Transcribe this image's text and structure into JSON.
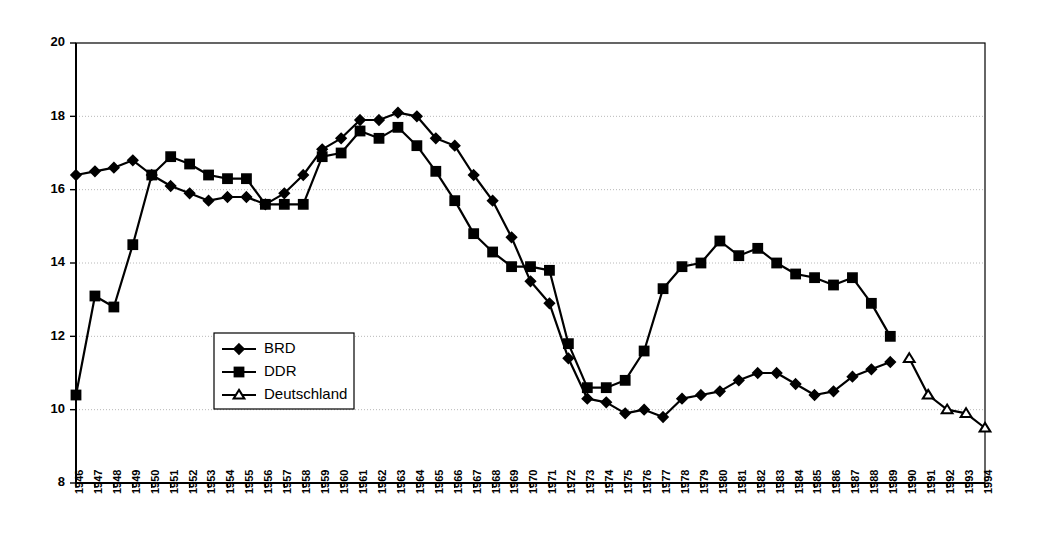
{
  "chart_data": {
    "type": "line",
    "title": "",
    "subtitle": "",
    "xlabel": "",
    "ylabel": "",
    "grid": true,
    "legend_position": "inside-left-lower",
    "xlim": [
      1946,
      1994
    ],
    "ylim": [
      8,
      20
    ],
    "ytick_step": 2,
    "yticks": [
      "8",
      "10",
      "12",
      "14",
      "16",
      "18",
      "20"
    ],
    "x": [
      1946,
      1947,
      1948,
      1949,
      1950,
      1951,
      1952,
      1953,
      1954,
      1955,
      1956,
      1957,
      1958,
      1959,
      1960,
      1961,
      1962,
      1963,
      1964,
      1965,
      1966,
      1967,
      1968,
      1969,
      1970,
      1971,
      1972,
      1973,
      1974,
      1975,
      1976,
      1977,
      1978,
      1979,
      1980,
      1981,
      1982,
      1983,
      1984,
      1985,
      1986,
      1987,
      1988,
      1989,
      1990,
      1991,
      1992,
      1993,
      1994
    ],
    "xticklabels": [
      "1946",
      "1947",
      "1948",
      "1949",
      "1950",
      "1951",
      "1952",
      "1953",
      "1954",
      "1955",
      "1956",
      "1957",
      "1958",
      "1959",
      "1960",
      "1961",
      "1962",
      "1963",
      "1964",
      "1965",
      "1966",
      "1967",
      "1968",
      "1969",
      "1970",
      "1971",
      "1972",
      "1973",
      "1974",
      "1975",
      "1976",
      "1977",
      "1978",
      "1979",
      "1980",
      "1981",
      "1982",
      "1983",
      "1984",
      "1985",
      "1986",
      "1987",
      "1988",
      "1989",
      "1990",
      "1991",
      "1992",
      "1993",
      "1994"
    ],
    "series": [
      {
        "name": "BRD",
        "marker": "diamond",
        "marker_style": "filled",
        "color": "#000000",
        "x": [
          1946,
          1947,
          1948,
          1949,
          1950,
          1951,
          1952,
          1953,
          1954,
          1955,
          1956,
          1957,
          1958,
          1959,
          1960,
          1961,
          1962,
          1963,
          1964,
          1965,
          1966,
          1967,
          1968,
          1969,
          1970,
          1971,
          1972,
          1973,
          1974,
          1975,
          1976,
          1977,
          1978,
          1979,
          1980,
          1981,
          1982,
          1983,
          1984,
          1985,
          1986,
          1987,
          1988,
          1989
        ],
        "values": [
          16.4,
          16.5,
          16.6,
          16.8,
          16.4,
          16.1,
          15.9,
          15.7,
          15.8,
          15.8,
          15.6,
          15.9,
          16.4,
          17.1,
          17.4,
          17.9,
          17.9,
          18.1,
          18.0,
          17.4,
          17.2,
          16.4,
          15.7,
          14.7,
          13.5,
          12.9,
          11.4,
          10.3,
          10.2,
          9.9,
          10.0,
          9.8,
          10.3,
          10.4,
          10.5,
          10.8,
          11.0,
          11.0,
          10.7,
          10.4,
          10.5,
          10.9,
          11.1,
          11.3
        ],
        "values_alt": [
          16.4,
          16.5,
          16.6,
          16.8,
          16.4,
          16.1,
          15.9,
          15.7,
          15.8,
          15.8,
          15.6,
          15.9,
          16.4,
          17.1,
          17.4,
          17.9,
          17.9,
          18.1,
          18.0,
          17.4,
          17.2,
          16.4,
          15.7,
          14.7,
          13.5,
          12.9,
          11.4,
          10.3,
          10.2,
          9.9,
          10.1,
          10.2,
          10.3,
          10.4,
          10.6,
          10.9,
          11.0,
          10.9,
          10.4,
          10.5,
          10.9,
          11.1,
          11.4,
          11.2
        ]
      },
      {
        "name": "DDR",
        "marker": "square",
        "marker_style": "filled",
        "color": "#000000",
        "x": [
          1946,
          1947,
          1948,
          1949,
          1950,
          1951,
          1952,
          1953,
          1954,
          1955,
          1956,
          1957,
          1958,
          1959,
          1960,
          1961,
          1962,
          1963,
          1964,
          1965,
          1966,
          1967,
          1968,
          1969,
          1970,
          1971,
          1972,
          1973,
          1974,
          1975,
          1976,
          1977,
          1978,
          1979,
          1980,
          1981,
          1982,
          1983,
          1984,
          1985,
          1986,
          1987,
          1988,
          1989
        ],
        "values": [
          10.4,
          13.1,
          12.8,
          14.5,
          16.4,
          16.9,
          16.7,
          16.4,
          16.3,
          16.3,
          15.6,
          15.6,
          15.6,
          16.9,
          17.0,
          17.6,
          17.4,
          17.7,
          17.2,
          16.5,
          15.7,
          14.8,
          14.3,
          13.9,
          13.9,
          13.8,
          11.8,
          10.6,
          10.6,
          10.8,
          11.6,
          13.3,
          13.9,
          14.0,
          14.6,
          14.2,
          14.4,
          14.0,
          13.7,
          13.6,
          13.4,
          13.6,
          12.9,
          12.0
        ]
      },
      {
        "name": "Deutschland",
        "marker": "triangle",
        "marker_style": "hollow",
        "color": "#000000",
        "x": [
          1990,
          1991,
          1992,
          1993,
          1994
        ],
        "values": [
          11.4,
          10.4,
          10.0,
          9.9,
          9.5
        ]
      }
    ]
  },
  "legend": {
    "items": [
      {
        "label": "BRD"
      },
      {
        "label": "DDR"
      },
      {
        "label": "Deutschland"
      }
    ]
  }
}
